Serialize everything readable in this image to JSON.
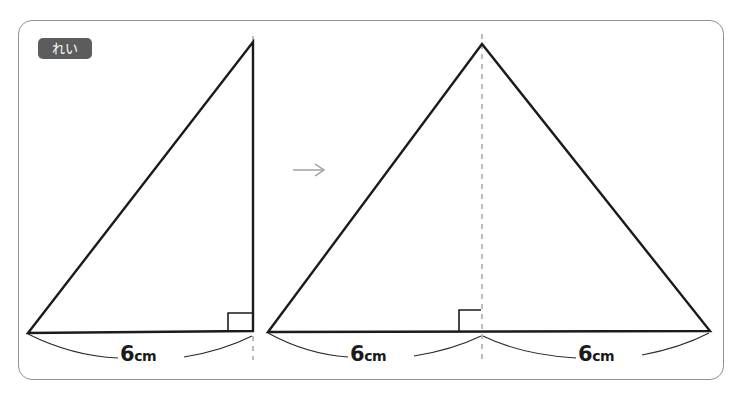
{
  "page": {
    "background_color": "#ffffff",
    "width": 742,
    "height": 399,
    "top_sliver_text": ""
  },
  "frame": {
    "border_color": "#8e9094",
    "corner_radius_px": 14
  },
  "badge": {
    "label": "れい",
    "background_color": "#5a5c5e",
    "text_color": "#ffffff"
  },
  "transform_arrow": {
    "glyph": "→",
    "color": "#9a9a9a"
  },
  "colors": {
    "stroke": "#1b1b1b",
    "dashed_guide": "#a8a8a8",
    "thin_line": "#2a2a2a"
  },
  "figures": [
    {
      "id": "left-triangle",
      "kind": "right-triangle",
      "apex": {
        "x": 253,
        "y": 42
      },
      "base_left": {
        "x": 28,
        "y": 333
      },
      "base_right": {
        "x": 253,
        "y": 331
      },
      "has_right_angle_mark": true,
      "dashed_guide_x": 253,
      "dimensions": [
        {
          "id": "dim-left",
          "number": "6",
          "unit": "cm",
          "from_x": 28,
          "to_x": 253
        }
      ]
    },
    {
      "id": "right-triangle",
      "kind": "isosceles-triangle",
      "apex": {
        "x": 482,
        "y": 44
      },
      "base_left": {
        "x": 268,
        "y": 332
      },
      "base_right": {
        "x": 710,
        "y": 331
      },
      "has_right_angle_mark": true,
      "dashed_guide_x": 482,
      "dimensions": [
        {
          "id": "dim-mid",
          "number": "6",
          "unit": "cm",
          "from_x": 268,
          "to_x": 482
        },
        {
          "id": "dim-right",
          "number": "6",
          "unit": "cm",
          "from_x": 482,
          "to_x": 710
        }
      ]
    }
  ],
  "labels": {
    "dim_left": {
      "number": "6",
      "unit": "cm"
    },
    "dim_mid": {
      "number": "6",
      "unit": "cm"
    },
    "dim_right": {
      "number": "6",
      "unit": "cm"
    }
  }
}
